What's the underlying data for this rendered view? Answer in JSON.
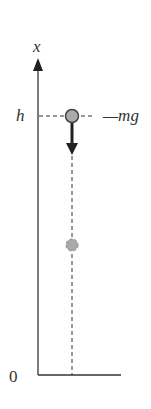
{
  "diagram": {
    "type": "free-fall-diagram",
    "axis_label": "x",
    "height_label": "h",
    "origin_label": "0",
    "force_label": "—mg",
    "balls": [
      {
        "name": "ball-at-height-h",
        "position": "h",
        "color": "#aaaaaa"
      },
      {
        "name": "ball-falling",
        "position": "mid",
        "color": "#aaaaaa"
      }
    ],
    "force_arrow": {
      "direction": "down",
      "color": "#222222"
    },
    "colors": {
      "ink": "#333333",
      "ball_fill": "#aaaaaa",
      "ball_stroke": "#444444"
    }
  }
}
